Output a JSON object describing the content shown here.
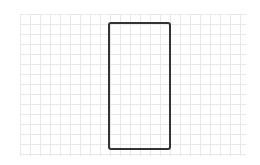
{
  "canvas": {
    "width": 260,
    "height": 165,
    "background": "#ffffff"
  },
  "grid": {
    "x": 20,
    "y": 14,
    "width": 226,
    "height": 142,
    "spacing": 10,
    "line_color": "#e6e6e6"
  },
  "shapes": [
    {
      "type": "rounded-rectangle",
      "x": 108,
      "y": 22,
      "width": 63,
      "height": 128,
      "stroke": "#333333",
      "stroke_width": 2,
      "corner_radius": 3,
      "fill": "none"
    }
  ]
}
